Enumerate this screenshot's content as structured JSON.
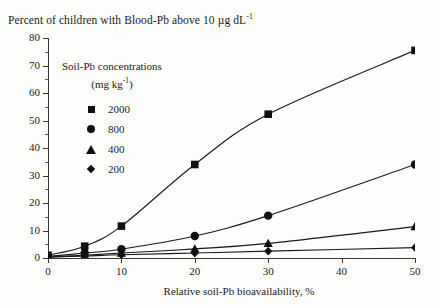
{
  "chart_data": {
    "type": "line",
    "title": "Percent of children with Blood-Pb above 10 µg dL",
    "title_sup": "-1",
    "xlabel": "Relative soil-Pb bioavailability, %",
    "ylabel": "",
    "xlim": [
      0,
      50
    ],
    "ylim": [
      0,
      80
    ],
    "xticks": [
      0,
      10,
      20,
      30,
      40,
      50
    ],
    "yticks": [
      0,
      10,
      20,
      30,
      40,
      50,
      60,
      70,
      80
    ],
    "grid": false,
    "legend_position": "upper-left-inside",
    "legend_title_line1": "Soil-Pb concentrations",
    "legend_title_line2": "(mg kg",
    "legend_title_line2_sup": "-1",
    "legend_title_line2_end": ")",
    "x": [
      0,
      5,
      10,
      20,
      30,
      50
    ],
    "series": [
      {
        "name": "2000",
        "marker": "square",
        "values": [
          1.0,
          4.3,
          11.6,
          34.0,
          52.3,
          75.5
        ]
      },
      {
        "name": "800",
        "marker": "circle",
        "values": [
          0.6,
          1.8,
          3.2,
          8.0,
          15.4,
          34.0
        ]
      },
      {
        "name": "400",
        "marker": "triangle",
        "values": [
          0.4,
          1.0,
          1.8,
          3.3,
          5.3,
          11.4
        ]
      },
      {
        "name": "200",
        "marker": "diamond",
        "values": [
          0.3,
          0.7,
          1.2,
          1.8,
          2.5,
          3.8
        ]
      }
    ]
  },
  "axis": {
    "y_tick_labels": [
      "80",
      "70",
      "60",
      "50",
      "40",
      "30",
      "20",
      "10",
      "0"
    ],
    "x_tick_labels": [
      "0",
      "10",
      "20",
      "30",
      "40",
      "50"
    ]
  },
  "colors": {
    "line": "#1a1a1a",
    "marker": "#111111",
    "axis": "#3a3a38",
    "background": "#fdfdfb"
  }
}
